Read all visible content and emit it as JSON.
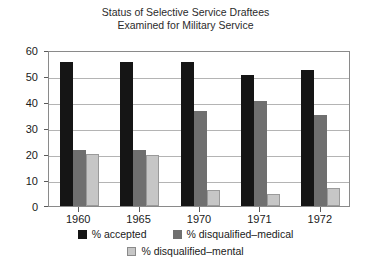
{
  "chart_data": {
    "type": "bar",
    "title": "Status of Selective Service Draftees Examined for Military Service",
    "title_line1": "Status of Selective Service Draftees",
    "title_line2": "Examined for Military Service",
    "xlabel": "",
    "ylabel": "",
    "categories": [
      "1960",
      "1965",
      "1970",
      "1971",
      "1972"
    ],
    "series": [
      {
        "name": "% accepted",
        "color": "#151515",
        "values": [
          55.5,
          55.5,
          55.5,
          50.5,
          52.5
        ]
      },
      {
        "name": "% disqualified–medical",
        "color": "#6f6f6f",
        "values": [
          21.5,
          21.5,
          36.5,
          40.5,
          35.0
        ]
      },
      {
        "name": "% disqualified–mental",
        "color": "#c6c6c6",
        "values": [
          20.0,
          19.5,
          6.0,
          4.5,
          7.0
        ]
      }
    ],
    "ylim": [
      0,
      60
    ],
    "yticks": [
      0,
      10,
      20,
      30,
      40,
      50,
      60
    ],
    "ytick_labels": [
      "0",
      "10",
      "20",
      "30",
      "40",
      "50",
      "60"
    ],
    "grid": true,
    "grid_axis": "y",
    "legend_position": "bottom",
    "legend": [
      "% accepted",
      "% disqualified–medical",
      "% disqualified–mental"
    ],
    "background": "#ffffff",
    "frame_color": "#8a8a8a",
    "gridline_color": "#b4b4b4"
  }
}
